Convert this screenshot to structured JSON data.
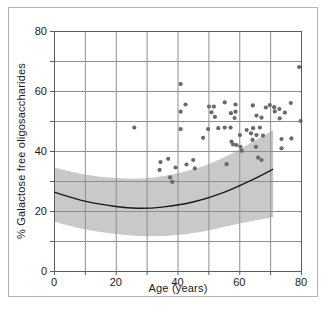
{
  "chart_data": {
    "type": "scatter",
    "title": "",
    "xlabel": "Age (years)",
    "ylabel": "% Galactose free oligosaccharides",
    "xlim": [
      0,
      80
    ],
    "ylim": [
      0,
      80
    ],
    "grid": true,
    "grid_interval": 10,
    "x_tick_labels": [
      "0",
      "20",
      "40",
      "60",
      "80"
    ],
    "y_tick_labels": [
      "0",
      "20",
      "40",
      "60",
      "80"
    ],
    "legend": "none",
    "points": [
      [
        26,
        47.8
      ],
      [
        34.5,
        36.3
      ],
      [
        34.2,
        33.7
      ],
      [
        37,
        37.4
      ],
      [
        39.4,
        34.5
      ],
      [
        37.6,
        31.2
      ],
      [
        38.3,
        29.7
      ],
      [
        41,
        62.3
      ],
      [
        41,
        53.1
      ],
      [
        42.6,
        55.5
      ],
      [
        41,
        47.3
      ],
      [
        42.9,
        35.5
      ],
      [
        45.6,
        34.2
      ],
      [
        45.1,
        37
      ],
      [
        48.3,
        44.4
      ],
      [
        49.9,
        47.3
      ],
      [
        53.2,
        47.6
      ],
      [
        55.3,
        47.8
      ],
      [
        57.2,
        47.8
      ],
      [
        50.2,
        54.8
      ],
      [
        51.8,
        54.8
      ],
      [
        51,
        52.9
      ],
      [
        52.1,
        51.4
      ],
      [
        55.3,
        56.2
      ],
      [
        57.3,
        52.6
      ],
      [
        58.8,
        55.5
      ],
      [
        58.8,
        53.1
      ],
      [
        58.5,
        51
      ],
      [
        55.9,
        35.6
      ],
      [
        57.5,
        43.1
      ],
      [
        59.1,
        42
      ],
      [
        58,
        42.2
      ],
      [
        60.2,
        45.3
      ],
      [
        60.4,
        41.4
      ],
      [
        60.8,
        40.1
      ],
      [
        62.4,
        47
      ],
      [
        64.5,
        47.6
      ],
      [
        66.7,
        47.8
      ],
      [
        63.8,
        45.9
      ],
      [
        65.6,
        45.3
      ],
      [
        67.7,
        45.1
      ],
      [
        64.3,
        43.7
      ],
      [
        65.4,
        41.4
      ],
      [
        66.1,
        37.8
      ],
      [
        67.2,
        37
      ],
      [
        64.4,
        55.2
      ],
      [
        68.6,
        54.5
      ],
      [
        69.9,
        55.3
      ],
      [
        71.3,
        54.6
      ],
      [
        71.5,
        53.2
      ],
      [
        73,
        54
      ],
      [
        74.8,
        52.8
      ],
      [
        76.7,
        56
      ],
      [
        65.6,
        51.8
      ],
      [
        67.2,
        51.1
      ],
      [
        73.1,
        50.9
      ],
      [
        79.9,
        50
      ],
      [
        73.7,
        44
      ],
      [
        76.9,
        44.2
      ],
      [
        73.7,
        40.9
      ],
      [
        79.4,
        68
      ]
    ],
    "regression_line": [
      [
        0,
        26.3
      ],
      [
        10,
        23.3
      ],
      [
        20,
        21.5
      ],
      [
        27,
        20.9
      ],
      [
        35,
        21.3
      ],
      [
        45,
        23
      ],
      [
        55,
        26.2
      ],
      [
        65,
        30.8
      ],
      [
        71,
        34
      ]
    ],
    "confidence_band": {
      "upper": [
        [
          0,
          34.5
        ],
        [
          10,
          32.2
        ],
        [
          20,
          31
        ],
        [
          30,
          30.9
        ],
        [
          40,
          32.6
        ],
        [
          50,
          35.6
        ],
        [
          60,
          40.5
        ],
        [
          71,
          47
        ]
      ],
      "lower": [
        [
          0,
          16.4
        ],
        [
          10,
          13.9
        ],
        [
          20,
          12.3
        ],
        [
          30,
          11.6
        ],
        [
          40,
          12
        ],
        [
          50,
          13.5
        ],
        [
          60,
          15.8
        ],
        [
          71,
          18
        ]
      ]
    },
    "colors": {
      "point": "#696969",
      "band": "#c9c9c9",
      "line": "#1a1a1a",
      "grid": "#8f8f8f",
      "frame": "#5c5c5c",
      "text": "#1a1a1a",
      "outer_border": "#b3b3b3",
      "background": "#ffffff"
    }
  }
}
